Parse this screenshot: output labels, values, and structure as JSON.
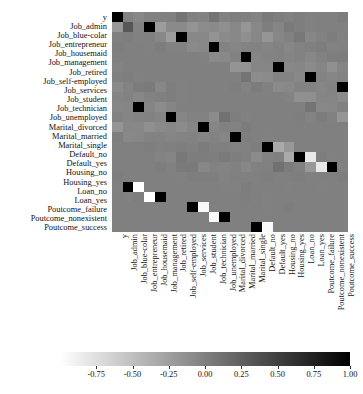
{
  "chart_data": {
    "type": "heatmap",
    "title": "",
    "xlabel": "",
    "ylabel": "",
    "grid": false,
    "legend_position": "bottom",
    "colormap": "Greys",
    "colorbar": {
      "min": -1.0,
      "max": 1.0,
      "ticks": [
        -0.75,
        -0.5,
        -0.25,
        0.0,
        0.25,
        0.5,
        0.75,
        1.0
      ],
      "tick_labels": [
        "-0.75",
        "-0.50",
        "-0.25",
        "0.00",
        "0.25",
        "0.50",
        "0.75",
        "1.00"
      ],
      "low_color": "#ffffff",
      "high_color": "#000000"
    },
    "categories": [
      "y",
      "Job_admin",
      "Job_blue-colar",
      "Job_entrepreneur",
      "Job_housemaid",
      "Job_management",
      "Job_retired",
      "Job_self-employed",
      "Job_services",
      "Job_student",
      "Job_technician",
      "Job_unemployed",
      "Marital_divorced",
      "Marital_married",
      "Marital_single",
      "Default_no",
      "Default_yes",
      "Housing_no",
      "Housing_yes",
      "Loan_no",
      "Loan_yes",
      "Poutcome_failure",
      "Poutcome_nonexistent",
      "Poutcome_success"
    ],
    "xticklabels": [
      "y",
      "Job_admin",
      "Job_blue-colar",
      "Job_entrepreneur",
      "Job_housemaid",
      "Job_management",
      "Job_retired",
      "Job_self-employed",
      "Job_services",
      "Job_student",
      "Job_technician",
      "Job_unemployed",
      "Marital_divorced",
      "Marital_married",
      "Marital_single",
      "Default_no",
      "Default_yes",
      "Housing_no",
      "Housing_yes",
      "Loan_no",
      "Loan_yes",
      "Poutcome_failure",
      "Poutcome_nonexistent",
      "Poutcome_success"
    ],
    "yticklabels": [
      "y",
      "Job_admin",
      "Job_blue-colar",
      "Job_entrepreneur",
      "Job_housemaid",
      "Job_management",
      "Job_retired",
      "Job_self-employed",
      "Job_services",
      "Job_student",
      "Job_technician",
      "Job_unemployed",
      "Marital_divorced",
      "Marital_married",
      "Marital_single",
      "Default_no",
      "Default_yes",
      "Housing_no",
      "Housing_yes",
      "Loan_no",
      "Loan_yes",
      "Poutcome_failure",
      "Poutcome_nonexistent",
      "Poutcome_success"
    ],
    "values": [
      [
        1.0,
        -0.02,
        -0.07,
        -0.02,
        -0.01,
        0.0,
        0.09,
        -0.01,
        -0.03,
        0.09,
        -0.01,
        0.01,
        0.0,
        -0.03,
        0.04,
        0.01,
        -0.01,
        0.01,
        -0.01,
        0.0,
        0.0,
        0.03,
        -0.19,
        0.32
      ],
      [
        -0.02,
        1.0,
        -0.22,
        -0.08,
        -0.08,
        -0.16,
        -0.1,
        -0.08,
        -0.13,
        -0.07,
        -0.18,
        -0.07,
        0.01,
        -0.04,
        0.04,
        0.01,
        -0.01,
        0.0,
        0.0,
        0.0,
        0.0,
        0.01,
        -0.01,
        0.0
      ],
      [
        -0.07,
        -0.22,
        1.0,
        -0.07,
        -0.07,
        -0.15,
        -0.09,
        -0.07,
        -0.12,
        -0.06,
        -0.17,
        -0.06,
        -0.01,
        0.06,
        -0.06,
        -0.02,
        0.02,
        -0.01,
        0.01,
        0.0,
        0.0,
        -0.01,
        0.02,
        -0.02
      ],
      [
        -0.02,
        -0.08,
        -0.07,
        1.0,
        -0.02,
        -0.05,
        -0.03,
        -0.02,
        -0.04,
        -0.02,
        -0.06,
        -0.02,
        0.0,
        0.02,
        -0.02,
        0.0,
        0.0,
        0.0,
        0.0,
        0.0,
        0.0,
        0.0,
        0.0,
        0.0
      ],
      [
        -0.01,
        -0.08,
        -0.07,
        -0.02,
        1.0,
        -0.05,
        -0.03,
        -0.02,
        -0.04,
        -0.02,
        -0.06,
        -0.02,
        0.01,
        0.02,
        -0.03,
        0.0,
        0.0,
        0.0,
        0.0,
        0.0,
        0.0,
        0.0,
        0.0,
        0.0
      ],
      [
        0.0,
        -0.16,
        -0.15,
        -0.05,
        -0.05,
        1.0,
        -0.07,
        -0.05,
        -0.09,
        -0.04,
        -0.13,
        -0.04,
        0.0,
        0.01,
        -0.01,
        0.0,
        0.0,
        0.0,
        0.0,
        0.0,
        0.0,
        0.0,
        0.0,
        0.0
      ],
      [
        0.09,
        -0.1,
        -0.09,
        -0.03,
        -0.03,
        -0.07,
        1.0,
        -0.03,
        -0.05,
        -0.03,
        -0.08,
        -0.03,
        0.03,
        0.04,
        -0.06,
        0.01,
        -0.01,
        0.0,
        0.0,
        0.0,
        0.0,
        0.01,
        -0.03,
        0.03
      ],
      [
        -0.01,
        -0.08,
        -0.07,
        -0.02,
        -0.02,
        -0.05,
        -0.03,
        1.0,
        -0.04,
        -0.02,
        -0.06,
        -0.02,
        0.0,
        0.01,
        -0.01,
        0.0,
        0.0,
        0.0,
        0.0,
        0.0,
        0.0,
        0.0,
        0.0,
        0.0
      ],
      [
        -0.03,
        -0.13,
        -0.12,
        -0.04,
        -0.04,
        -0.09,
        -0.05,
        -0.04,
        1.0,
        -0.04,
        -0.1,
        -0.04,
        0.0,
        0.0,
        0.0,
        0.0,
        0.0,
        0.0,
        0.0,
        0.0,
        0.0,
        0.0,
        0.0,
        0.0
      ],
      [
        0.09,
        -0.07,
        -0.06,
        -0.02,
        -0.02,
        -0.04,
        -0.03,
        -0.02,
        -0.04,
        1.0,
        -0.05,
        -0.02,
        -0.02,
        -0.09,
        0.11,
        0.01,
        -0.01,
        0.0,
        0.0,
        0.0,
        0.0,
        0.01,
        -0.03,
        0.03
      ],
      [
        -0.01,
        -0.18,
        -0.17,
        -0.06,
        -0.06,
        -0.13,
        -0.08,
        -0.06,
        -0.1,
        -0.05,
        1.0,
        -0.05,
        -0.01,
        -0.02,
        0.03,
        0.0,
        0.0,
        0.0,
        0.0,
        0.0,
        0.0,
        0.0,
        0.0,
        0.0
      ],
      [
        0.01,
        -0.07,
        -0.06,
        -0.02,
        -0.02,
        -0.04,
        -0.03,
        -0.02,
        -0.04,
        -0.02,
        -0.05,
        1.0,
        0.01,
        0.0,
        -0.01,
        0.0,
        0.0,
        0.0,
        0.0,
        0.0,
        0.0,
        0.0,
        0.0,
        0.0
      ],
      [
        0.0,
        0.01,
        -0.01,
        0.0,
        0.01,
        0.0,
        0.03,
        0.0,
        0.0,
        -0.02,
        -0.01,
        0.01,
        1.0,
        -0.33,
        -0.19,
        0.0,
        0.0,
        0.0,
        0.0,
        0.0,
        0.0,
        0.0,
        0.0,
        0.0
      ],
      [
        -0.03,
        -0.04,
        0.06,
        0.02,
        0.02,
        0.01,
        0.04,
        0.01,
        0.0,
        -0.09,
        -0.02,
        0.0,
        -0.33,
        1.0,
        -0.82,
        0.01,
        -0.01,
        0.0,
        0.0,
        0.0,
        0.0,
        0.0,
        0.01,
        -0.01
      ],
      [
        0.04,
        0.04,
        -0.06,
        -0.02,
        -0.03,
        -0.01,
        -0.06,
        -0.01,
        0.0,
        0.11,
        0.03,
        -0.01,
        -0.19,
        -0.82,
        1.0,
        -0.01,
        0.01,
        0.0,
        0.0,
        0.0,
        0.0,
        0.0,
        -0.01,
        0.01
      ],
      [
        0.01,
        0.01,
        -0.02,
        0.0,
        0.0,
        0.0,
        0.01,
        0.0,
        0.0,
        0.01,
        0.0,
        0.0,
        0.0,
        0.01,
        -0.01,
        1.0,
        -1.0,
        0.0,
        0.0,
        0.0,
        0.0,
        0.0,
        0.0,
        0.0
      ],
      [
        -0.01,
        -0.01,
        0.02,
        0.0,
        0.0,
        0.0,
        -0.01,
        0.0,
        0.0,
        -0.01,
        0.0,
        0.0,
        0.0,
        -0.01,
        0.01,
        -1.0,
        1.0,
        0.0,
        0.0,
        0.0,
        0.0,
        0.0,
        0.0,
        0.0
      ],
      [
        0.01,
        0.0,
        -0.01,
        0.0,
        0.0,
        0.0,
        0.0,
        0.0,
        0.0,
        0.0,
        0.0,
        0.0,
        0.0,
        0.0,
        0.0,
        0.0,
        0.0,
        1.0,
        -0.95,
        0.0,
        0.0,
        0.0,
        0.0,
        0.0
      ],
      [
        -0.01,
        0.0,
        0.01,
        0.0,
        0.0,
        0.0,
        0.0,
        0.0,
        0.0,
        0.0,
        0.0,
        0.0,
        0.0,
        0.0,
        0.0,
        0.0,
        0.0,
        -0.95,
        1.0,
        0.0,
        0.0,
        0.0,
        0.0,
        0.0
      ],
      [
        0.0,
        0.0,
        0.0,
        0.0,
        0.0,
        0.0,
        0.0,
        0.0,
        0.0,
        0.0,
        0.0,
        0.0,
        0.0,
        0.0,
        0.0,
        0.0,
        0.0,
        0.0,
        0.0,
        1.0,
        -0.95,
        0.0,
        0.0,
        0.0
      ],
      [
        0.0,
        0.0,
        0.0,
        0.0,
        0.0,
        0.0,
        0.0,
        0.0,
        0.0,
        0.0,
        0.0,
        0.0,
        0.0,
        0.0,
        0.0,
        0.0,
        0.0,
        0.0,
        0.0,
        -0.95,
        1.0,
        0.0,
        0.0,
        0.0
      ],
      [
        0.03,
        0.01,
        -0.01,
        0.0,
        0.0,
        0.0,
        0.01,
        0.0,
        0.0,
        0.01,
        0.0,
        0.0,
        0.0,
        0.0,
        0.0,
        0.0,
        0.0,
        0.0,
        0.0,
        0.0,
        0.0,
        1.0,
        -0.85,
        -0.1
      ],
      [
        -0.19,
        -0.01,
        0.02,
        0.0,
        0.0,
        0.0,
        -0.03,
        0.0,
        0.0,
        -0.03,
        0.0,
        0.0,
        0.0,
        0.01,
        -0.01,
        0.0,
        0.0,
        0.0,
        0.0,
        0.0,
        0.0,
        -0.85,
        1.0,
        -0.43
      ],
      [
        0.32,
        0.0,
        -0.02,
        0.0,
        0.0,
        0.0,
        0.03,
        0.0,
        0.0,
        0.03,
        0.0,
        0.0,
        0.0,
        -0.01,
        0.01,
        0.0,
        0.0,
        0.0,
        0.0,
        0.0,
        0.0,
        -0.1,
        -0.43,
        1.0
      ]
    ]
  }
}
